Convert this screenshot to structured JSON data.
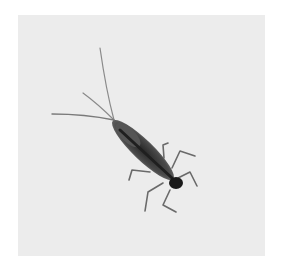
{
  "image": {
    "subject": "mayfly nymph on light gray background",
    "alt": "Mayfly nymph photograph",
    "background_color": "#ececec",
    "page_color": "#ffffff",
    "body_color": "#3a3a3a",
    "head_color": "#1a1a1a"
  }
}
